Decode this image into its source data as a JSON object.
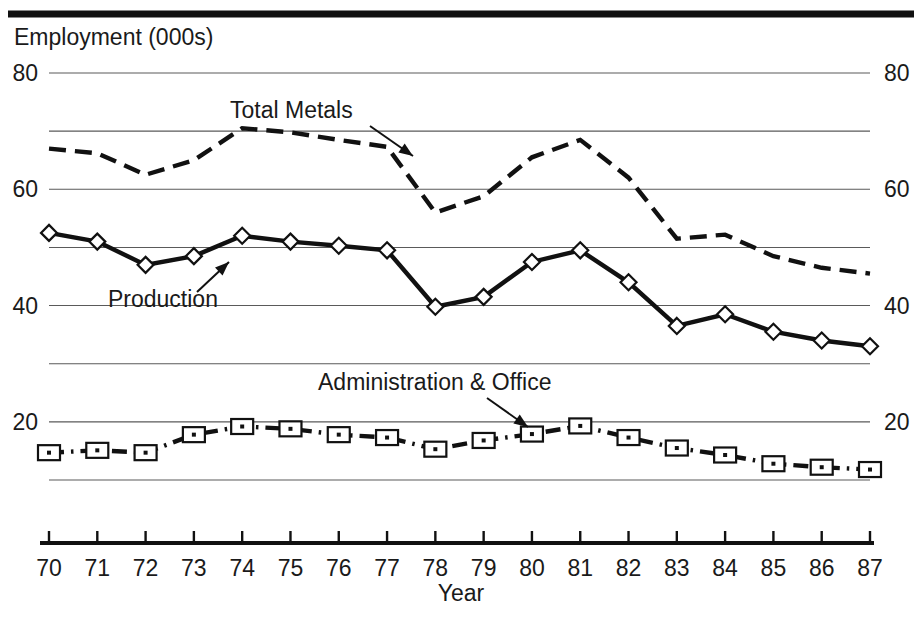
{
  "chart_data": {
    "type": "line",
    "title": "",
    "ylabel": "Employment (000s)",
    "xlabel": "Year",
    "ylim": [
      10,
      80
    ],
    "ytick_labels": [
      "80",
      "60",
      "40",
      "20"
    ],
    "ytick_values": [
      80,
      60,
      40,
      20
    ],
    "gridlines": [
      80,
      70,
      60,
      50,
      40,
      30,
      20,
      10
    ],
    "grid": true,
    "legend_position": "inline-annotations",
    "categories": [
      "70",
      "71",
      "72",
      "73",
      "74",
      "75",
      "76",
      "77",
      "78",
      "79",
      "80",
      "81",
      "82",
      "83",
      "84",
      "85",
      "86",
      "87"
    ],
    "x": [
      70,
      71,
      72,
      73,
      74,
      75,
      76,
      77,
      78,
      79,
      80,
      81,
      82,
      83,
      84,
      85,
      86,
      87
    ],
    "series": [
      {
        "name": "Total Metals",
        "style": "dashed",
        "marker": "none",
        "values": [
          67.0,
          66.2,
          62.5,
          65.0,
          70.5,
          69.8,
          68.5,
          67.3,
          56.0,
          58.8,
          65.5,
          68.5,
          62.0,
          51.5,
          52.2,
          48.5,
          46.5,
          45.5
        ]
      },
      {
        "name": "Production",
        "style": "solid",
        "marker": "diamond",
        "values": [
          52.5,
          51.0,
          47.0,
          48.5,
          52.0,
          51.0,
          50.3,
          49.5,
          39.8,
          41.5,
          47.5,
          49.5,
          44.0,
          36.5,
          38.5,
          35.5,
          34.0,
          33.0
        ]
      },
      {
        "name": "Administration & Office",
        "style": "dashdot",
        "marker": "square",
        "values": [
          14.7,
          15.1,
          14.7,
          17.8,
          19.2,
          18.8,
          17.8,
          17.3,
          15.3,
          16.8,
          17.9,
          19.3,
          17.3,
          15.5,
          14.3,
          12.8,
          12.2,
          11.8
        ]
      }
    ],
    "annotations": [
      {
        "label": "Total Metals",
        "series": "Total Metals",
        "text_x": 230,
        "text_y": 118,
        "arrow_x1": 370,
        "arrow_y1": 126,
        "arrow_x2": 413,
        "arrow_y2": 156
      },
      {
        "label": "Production",
        "series": "Production",
        "text_x": 108,
        "text_y": 307,
        "arrow_x1": 197,
        "arrow_y1": 292,
        "arrow_x2": 229,
        "arrow_y2": 262
      },
      {
        "label": "Administration & Office",
        "series": "Administration & Office",
        "text_x": 318,
        "text_y": 390,
        "arrow_x1": 487,
        "arrow_y1": 398,
        "arrow_x2": 528,
        "arrow_y2": 427
      }
    ]
  },
  "axis": {
    "y_title": "Employment (000s)",
    "x_title": "Year",
    "left_ticks": [
      "80",
      "60",
      "40",
      "20"
    ],
    "right_ticks": [
      "80",
      "60",
      "40",
      "20"
    ],
    "x_ticks": [
      "70",
      "71",
      "72",
      "73",
      "74",
      "75",
      "76",
      "77",
      "78",
      "79",
      "80",
      "81",
      "82",
      "83",
      "84",
      "85",
      "86",
      "87"
    ]
  },
  "colors": {
    "line": "#111111",
    "grid": "#5a5a5a",
    "background": "#ffffff",
    "text": "#1a1a1a"
  }
}
